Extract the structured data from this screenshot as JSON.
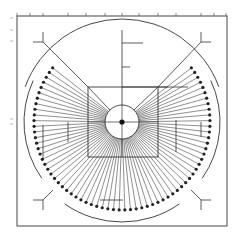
{
  "diagram": {
    "title": "",
    "type": "radial fan test pattern",
    "colors": {
      "stroke": "#333333",
      "dot": "#222222",
      "background": "#ffffff",
      "tick": "#555555"
    },
    "frame": {
      "x": 17,
      "y": 16,
      "width": 210,
      "height": 210
    },
    "center": {
      "x": 122,
      "y": 122
    },
    "hub_circle_radius": 17,
    "center_dot_radius": 2.6,
    "inner_square": {
      "x": 88,
      "y": 87,
      "size": 70
    },
    "dot_ring": {
      "radius": 88,
      "start_deg": -38,
      "end_deg": 218,
      "count": 70,
      "dot_radius": 1.6
    },
    "outer_arc": {
      "radius": 103,
      "start_deg": 180,
      "end_deg": 360
    },
    "side_arcs": {
      "radius": 98
    },
    "top_axis_ticks": [
      17,
      30,
      43,
      68,
      86,
      105,
      122,
      139,
      158,
      176,
      201,
      214,
      226
    ],
    "left_axis_labels": [
      {
        "y": 18,
        "text": "—"
      },
      {
        "y": 30,
        "text": "—"
      },
      {
        "y": 41,
        "text": "—"
      },
      {
        "y": 119,
        "text": "—"
      },
      {
        "y": 124,
        "text": "—"
      }
    ]
  }
}
